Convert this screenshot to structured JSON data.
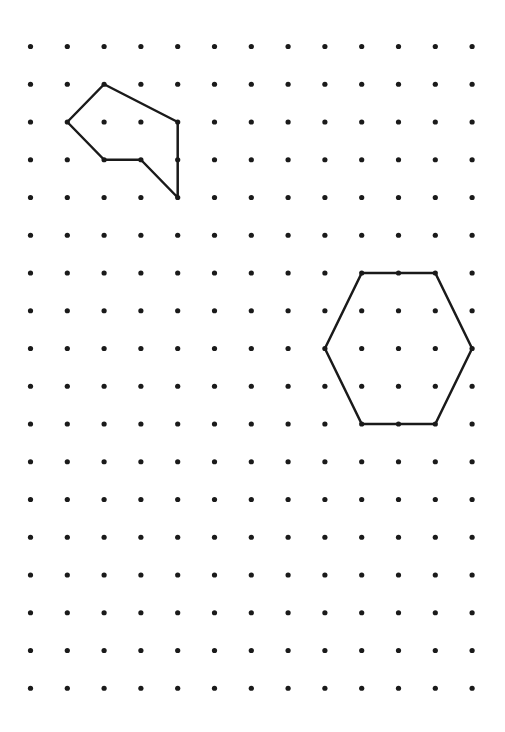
{
  "grid": {
    "columns": 13,
    "rows": 18,
    "dot_color": "#1a1a1a"
  },
  "shapes": [
    {
      "name": "irregular-hexagon",
      "stroke": "#1a1a1a",
      "vertices": [
        [
          2,
          1
        ],
        [
          4,
          2
        ],
        [
          4,
          4
        ],
        [
          3,
          3
        ],
        [
          2,
          3
        ],
        [
          1,
          2
        ]
      ]
    },
    {
      "name": "regular-hexagon",
      "stroke": "#1a1a1a",
      "vertices": [
        [
          9,
          6
        ],
        [
          11,
          6
        ],
        [
          12,
          8
        ],
        [
          11,
          10
        ],
        [
          9,
          10
        ],
        [
          8,
          8
        ]
      ]
    }
  ]
}
